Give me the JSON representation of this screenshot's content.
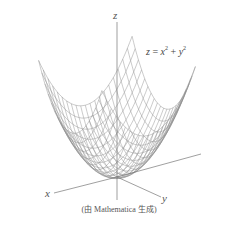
{
  "figure": {
    "equation": {
      "lhs": "z",
      "eq": " = ",
      "x": "x",
      "exp1": "2",
      "plus": " +",
      "y": "y",
      "exp2": "2"
    },
    "axes": {
      "x_label": "x",
      "y_label": "y",
      "z_label": "z"
    },
    "caption": "(由 Mathematica 生成)",
    "surface": "paraboloid z = x^2 + y^2, wireframe mesh",
    "colors": {
      "mesh": "#8a8a8a",
      "axis": "#777777",
      "surface_fill": "#f4f4f4"
    }
  }
}
